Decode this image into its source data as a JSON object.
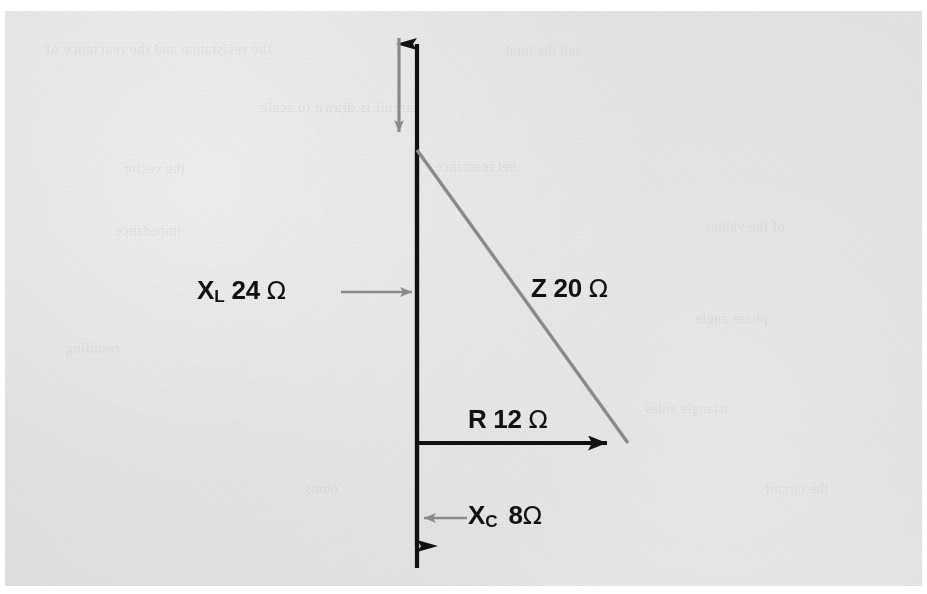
{
  "figure": {
    "kind": "impedance-phasor-triangle",
    "caption_none": "",
    "background_color": "#e3e3e3",
    "ink_color": "#111111",
    "accent_color": "#8a8a8a"
  },
  "labels": {
    "inductive_reactance": {
      "symbol": "X",
      "subscript": "L",
      "value": "24",
      "unit": "Ω",
      "full": "X_L 24 Ω"
    },
    "impedance": {
      "symbol": "Z",
      "subscript": "",
      "value": "20",
      "unit": "Ω",
      "full": "Z 20 Ω"
    },
    "resistance": {
      "symbol": "R",
      "subscript": "",
      "value": "12",
      "unit": "Ω",
      "full": "R 12 Ω"
    },
    "capacitive_reactance": {
      "symbol": "X",
      "subscript": "C",
      "value": "8",
      "unit": "Ω",
      "full": "X_C 8 Ω"
    }
  },
  "ghost_text": [
    {
      "text": "the resistance and the reactance of",
      "x": 40,
      "y": 30,
      "size": 15
    },
    {
      "text": "and the total",
      "x": 500,
      "y": 32,
      "size": 14
    },
    {
      "text": "circuit is drawn to scale",
      "x": 255,
      "y": 88,
      "size": 15
    },
    {
      "text": "the vector",
      "x": 118,
      "y": 150,
      "size": 14
    },
    {
      "text": "net reactance",
      "x": 430,
      "y": 148,
      "size": 14
    },
    {
      "text": "of the values",
      "x": 700,
      "y": 208,
      "size": 14
    },
    {
      "text": "impedance",
      "x": 110,
      "y": 212,
      "size": 14
    },
    {
      "text": "phase angle",
      "x": 690,
      "y": 300,
      "size": 14
    },
    {
      "text": "triangle sides",
      "x": 640,
      "y": 390,
      "size": 14
    },
    {
      "text": "resulting",
      "x": 60,
      "y": 330,
      "size": 14
    },
    {
      "text": "the circuit",
      "x": 760,
      "y": 470,
      "size": 14
    },
    {
      "text": "ohms",
      "x": 300,
      "y": 470,
      "size": 14
    }
  ],
  "chart_data": {
    "type": "scatter",
    "xlabel": "Resistance (Ω)",
    "ylabel": "Reactance (Ω)",
    "xlim": [
      0,
      14
    ],
    "ylim": [
      -10,
      28
    ],
    "grid": false,
    "legend": "none",
    "series": [
      {
        "name": "R 12 Ω",
        "kind": "vector",
        "from": [
          0,
          0
        ],
        "to": [
          12,
          0
        ],
        "value": 12,
        "unit": "Ω",
        "color": "#111111",
        "arrow": true
      },
      {
        "name": "X_L 24 Ω",
        "kind": "vector",
        "from": [
          0,
          0
        ],
        "to": [
          0,
          24
        ],
        "value": 24,
        "unit": "Ω",
        "color": "#111111",
        "arrow": true
      },
      {
        "name": "X_C 8 Ω",
        "kind": "vector",
        "from": [
          0,
          0
        ],
        "to": [
          0,
          -8
        ],
        "value": 8,
        "unit": "Ω",
        "color": "#111111",
        "arrow": true
      },
      {
        "name": "Z 20 Ω",
        "kind": "hypotenuse",
        "from": [
          0,
          16
        ],
        "to": [
          12,
          0
        ],
        "value": 20,
        "unit": "Ω",
        "color": "#8a8a8a",
        "arrow": false
      }
    ],
    "annotations": [
      {
        "text": "X_L 24 Ω",
        "leader": "arrow-right",
        "target": "vertical-axis"
      },
      {
        "text": "Z 20 Ω",
        "leader": "none",
        "target": "hypotenuse"
      },
      {
        "text": "R 12 Ω",
        "leader": "none",
        "target": "horizontal-vector"
      },
      {
        "text": "X_C 8 Ω",
        "leader": "arrow-left",
        "target": "vertical-axis-lower"
      },
      {
        "text": "",
        "leader": "arrow-down",
        "target": "net-reactance-point"
      }
    ]
  }
}
